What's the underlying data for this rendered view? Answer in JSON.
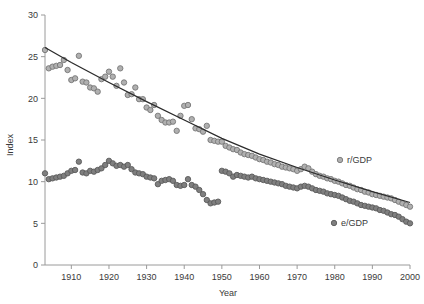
{
  "chart_data": {
    "type": "scatter",
    "title": "",
    "xlabel": "Year",
    "ylabel": "Index",
    "xlim": [
      1903,
      2000
    ],
    "ylim": [
      0,
      30
    ],
    "xticks": [
      1910,
      1920,
      1930,
      1940,
      1950,
      1960,
      1970,
      1980,
      1990,
      2000
    ],
    "yticks": [
      0,
      5,
      10,
      15,
      20,
      25,
      30
    ],
    "xtick_labels": [
      "1910",
      "1920",
      "1930",
      "1940",
      "1950",
      "1960",
      "1970",
      "1980",
      "1990",
      "2000"
    ],
    "ytick_labels": [
      "0",
      "5",
      "10",
      "15",
      "20",
      "25",
      "30"
    ],
    "grid": false,
    "legend_position": "inside-right",
    "marker_style": "open-circle-gray",
    "marker_fill": "#a8a8a8",
    "marker_stroke": "#6e6e6e",
    "trendline_color": "#2b2b2b",
    "series": [
      {
        "name": "r/GDP",
        "label": "r/GDP",
        "color": "#b0b0b0",
        "stroke": "#767676",
        "x": [
          1903,
          1904,
          1905,
          1906,
          1907,
          1908,
          1909,
          1910,
          1911,
          1912,
          1913,
          1914,
          1915,
          1916,
          1917,
          1918,
          1919,
          1920,
          1921,
          1922,
          1923,
          1924,
          1925,
          1926,
          1927,
          1928,
          1929,
          1930,
          1931,
          1932,
          1933,
          1934,
          1935,
          1936,
          1937,
          1938,
          1939,
          1940,
          1941,
          1942,
          1943,
          1944,
          1945,
          1946,
          1947,
          1948,
          1949,
          1950,
          1951,
          1952,
          1953,
          1954,
          1955,
          1956,
          1957,
          1958,
          1959,
          1960,
          1961,
          1962,
          1963,
          1964,
          1965,
          1966,
          1967,
          1968,
          1969,
          1970,
          1971,
          1972,
          1973,
          1974,
          1975,
          1976,
          1977,
          1978,
          1979,
          1980,
          1981,
          1982,
          1983,
          1984,
          1985,
          1986,
          1987,
          1988,
          1989,
          1990,
          1991,
          1992,
          1993,
          1994,
          1995,
          1996,
          1997,
          1998,
          1999,
          2000
        ],
        "y": [
          25.8,
          23.6,
          23.8,
          23.9,
          24.0,
          24.6,
          23.4,
          22.2,
          22.4,
          25.1,
          22.0,
          21.9,
          21.3,
          21.2,
          20.8,
          22.3,
          22.6,
          23.2,
          22.6,
          21.5,
          23.6,
          21.9,
          20.4,
          20.5,
          21.3,
          19.9,
          19.9,
          18.9,
          18.6,
          19.2,
          17.9,
          17.4,
          17.1,
          17.1,
          17.2,
          16.1,
          17.9,
          19.1,
          19.2,
          17.5,
          16.4,
          16.3,
          16.0,
          16.7,
          15.0,
          14.9,
          14.8,
          14.8,
          14.3,
          14.1,
          13.9,
          13.8,
          13.5,
          13.3,
          13.2,
          13.1,
          12.9,
          12.7,
          12.6,
          12.4,
          12.3,
          12.1,
          12.0,
          11.8,
          11.7,
          11.6,
          11.5,
          11.3,
          11.5,
          11.8,
          11.6,
          11.2,
          10.9,
          10.7,
          10.6,
          10.4,
          10.3,
          10.1,
          10.0,
          9.8,
          9.6,
          9.5,
          9.3,
          9.1,
          9.0,
          8.8,
          8.7,
          8.5,
          8.4,
          8.3,
          8.2,
          8.1,
          8.0,
          7.8,
          7.6,
          7.4,
          7.2,
          7.0
        ]
      },
      {
        "name": "e/GDP",
        "label": "e/GDP",
        "color": "#7f7f7f",
        "stroke": "#5a5a5a",
        "x": [
          1903,
          1904,
          1905,
          1906,
          1907,
          1908,
          1909,
          1910,
          1911,
          1912,
          1913,
          1914,
          1915,
          1916,
          1917,
          1918,
          1919,
          1920,
          1921,
          1922,
          1923,
          1924,
          1925,
          1926,
          1927,
          1928,
          1929,
          1930,
          1931,
          1932,
          1933,
          1934,
          1935,
          1936,
          1937,
          1938,
          1939,
          1940,
          1941,
          1942,
          1943,
          1944,
          1945,
          1946,
          1947,
          1948,
          1949,
          1950,
          1951,
          1952,
          1953,
          1954,
          1955,
          1956,
          1957,
          1958,
          1959,
          1960,
          1961,
          1962,
          1963,
          1964,
          1965,
          1966,
          1967,
          1968,
          1969,
          1970,
          1971,
          1972,
          1973,
          1974,
          1975,
          1976,
          1977,
          1978,
          1979,
          1980,
          1981,
          1982,
          1983,
          1984,
          1985,
          1986,
          1987,
          1988,
          1989,
          1990,
          1991,
          1992,
          1993,
          1994,
          1995,
          1996,
          1997,
          1998,
          1999,
          2000
        ],
        "y": [
          11.0,
          10.3,
          10.4,
          10.5,
          10.6,
          10.7,
          11.0,
          11.3,
          11.4,
          12.4,
          11.1,
          11.0,
          11.3,
          11.2,
          11.4,
          11.6,
          12.0,
          12.5,
          12.2,
          11.9,
          12.0,
          11.8,
          12.0,
          11.5,
          11.1,
          11.0,
          10.9,
          10.6,
          10.5,
          10.4,
          9.7,
          10.1,
          10.2,
          10.3,
          10.1,
          9.6,
          9.5,
          9.6,
          10.3,
          9.6,
          9.4,
          9.0,
          8.5,
          7.8,
          7.4,
          7.5,
          7.6,
          11.3,
          11.2,
          11.0,
          10.6,
          10.8,
          10.7,
          10.6,
          10.5,
          10.6,
          10.4,
          10.3,
          10.2,
          10.1,
          10.0,
          9.9,
          9.8,
          9.7,
          9.5,
          9.4,
          9.3,
          9.2,
          9.4,
          9.5,
          9.4,
          9.2,
          9.0,
          8.9,
          8.8,
          8.6,
          8.5,
          8.4,
          8.3,
          8.1,
          7.9,
          7.7,
          7.6,
          7.4,
          7.2,
          7.1,
          7.0,
          6.9,
          6.8,
          6.6,
          6.5,
          6.3,
          6.1,
          6.0,
          5.8,
          5.5,
          5.2,
          5.0
        ]
      }
    ],
    "trendline": {
      "name": "r/GDP trend",
      "x": [
        1903,
        1910,
        1920,
        1930,
        1940,
        1950,
        1960,
        1970,
        1980,
        1990,
        2000
      ],
      "y": [
        26.1,
        24.3,
        21.9,
        19.6,
        17.4,
        15.2,
        13.3,
        11.7,
        10.2,
        8.8,
        7.5
      ]
    },
    "legend": [
      {
        "label": "r/GDP",
        "marker_fill": "#b0b0b0",
        "marker_stroke": "#767676"
      },
      {
        "label": "e/GDP",
        "marker_fill": "#7f7f7f",
        "marker_stroke": "#5a5a5a"
      }
    ]
  }
}
